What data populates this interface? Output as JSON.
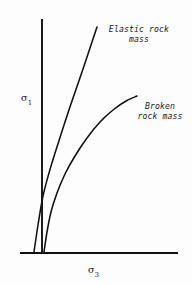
{
  "figure": {
    "background_color": "#fdfdfd",
    "ink_color": "#111111",
    "annotations": {
      "elastic_line1": "Elastic rock",
      "elastic_line2": "mass",
      "broken_line1": "Broken",
      "broken_line2": "rock mass"
    },
    "axes": {
      "y_symbol": "σ",
      "y_subscript": "1",
      "x_symbol": "σ",
      "x_subscript": "3"
    }
  },
  "chart_data": {
    "type": "line",
    "title": "",
    "subtitle": "",
    "xlabel": "σ₃",
    "ylabel": "σ₁",
    "grid": false,
    "legend_position": "inline-annotation",
    "axis_style": "open (no ticks, no numeric scale)",
    "xlim": [
      0,
      1
    ],
    "ylim": [
      0,
      1
    ],
    "series": [
      {
        "name": "Elastic rock mass",
        "label_line1": "Elastic rock",
        "label_line2": "mass",
        "color": "#111111",
        "shape": "steep, slightly concave-up then near-linear",
        "points_px": [
          [
            34,
            252
          ],
          [
            38,
            225
          ],
          [
            43,
            196
          ],
          [
            49,
            173
          ],
          [
            56,
            150
          ],
          [
            64,
            125
          ],
          [
            73,
            98
          ],
          [
            82,
            72
          ],
          [
            90,
            48
          ],
          [
            97,
            27
          ]
        ]
      },
      {
        "name": "Broken rock mass",
        "label_line1": "Broken",
        "label_line2": "rock mass",
        "color": "#111111",
        "shape": "concave-down power-law envelope",
        "points_px": [
          [
            44,
            252
          ],
          [
            47,
            232
          ],
          [
            51,
            212
          ],
          [
            57,
            193
          ],
          [
            65,
            174
          ],
          [
            75,
            156
          ],
          [
            87,
            138
          ],
          [
            100,
            122
          ],
          [
            113,
            110
          ],
          [
            126,
            101
          ],
          [
            137,
            96
          ]
        ]
      }
    ],
    "axis_lines_px": {
      "y_axis": {
        "x": 42,
        "y_top": 19,
        "y_bottom": 253
      },
      "x_axis": {
        "y": 253,
        "x_left": 20,
        "x_right": 178
      }
    }
  }
}
